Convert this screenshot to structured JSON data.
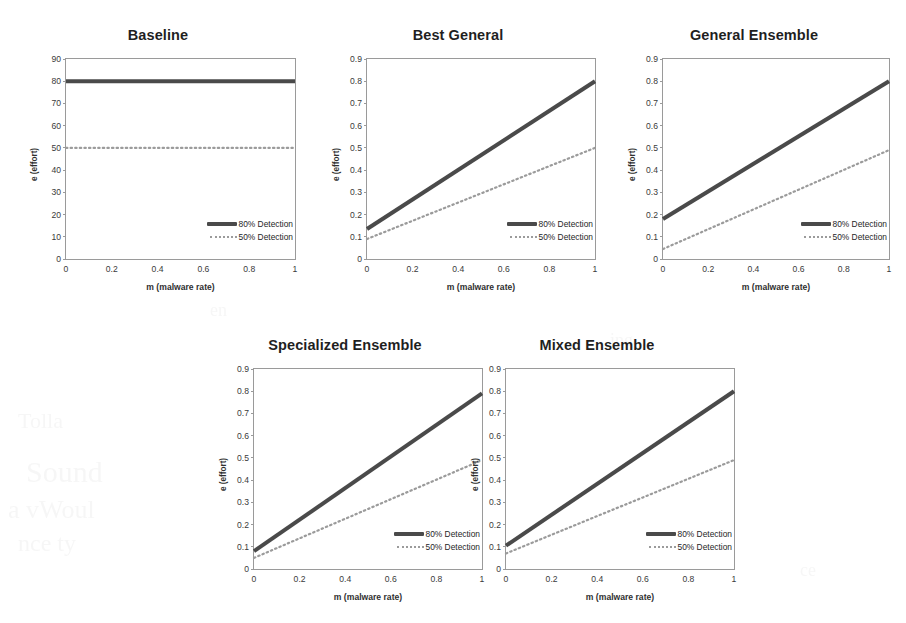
{
  "figure": {
    "series_labels": {
      "detection80": "80% Detection",
      "detection50": "50% Detection"
    },
    "axis": {
      "xlabel": "m (malware rate)",
      "ylabel": "e (effort)"
    }
  },
  "chart_data": [
    {
      "type": "line",
      "title": "Baseline",
      "xlabel": "m (malware rate)",
      "ylabel": "e (effort)",
      "xlim": [
        0,
        1
      ],
      "ylim": [
        0,
        90
      ],
      "xticks": [
        "0",
        "0.2",
        "0.4",
        "0.6",
        "0.8",
        "1"
      ],
      "yticks": [
        "0",
        "10",
        "20",
        "30",
        "40",
        "50",
        "60",
        "70",
        "80",
        "90"
      ],
      "grid": false,
      "legend_position": "lower-right",
      "x": [
        0,
        1
      ],
      "series": [
        {
          "name": "80% Detection",
          "style": "solid",
          "values": [
            80,
            80
          ]
        },
        {
          "name": "50% Detection",
          "style": "dotted",
          "values": [
            50,
            50
          ]
        }
      ]
    },
    {
      "type": "line",
      "title": "Best General",
      "xlabel": "m (malware rate)",
      "ylabel": "e (effort)",
      "xlim": [
        0,
        1
      ],
      "ylim": [
        0,
        0.9
      ],
      "xticks": [
        "0",
        "0.2",
        "0.4",
        "0.6",
        "0.8",
        "1"
      ],
      "yticks": [
        "0",
        "0.1",
        "0.2",
        "0.3",
        "0.4",
        "0.5",
        "0.6",
        "0.7",
        "0.8",
        "0.9"
      ],
      "grid": false,
      "legend_position": "lower-right",
      "x": [
        0,
        1
      ],
      "series": [
        {
          "name": "80% Detection",
          "style": "solid",
          "values": [
            0.135,
            0.8
          ]
        },
        {
          "name": "50% Detection",
          "style": "dotted",
          "values": [
            0.09,
            0.5
          ]
        }
      ]
    },
    {
      "type": "line",
      "title": "General Ensemble",
      "xlabel": "m (malware rate)",
      "ylabel": "e (effort)",
      "xlim": [
        0,
        1
      ],
      "ylim": [
        0,
        0.9
      ],
      "xticks": [
        "0",
        "0.2",
        "0.4",
        "0.6",
        "0.8",
        "1"
      ],
      "yticks": [
        "0",
        "0.1",
        "0.2",
        "0.3",
        "0.4",
        "0.5",
        "0.6",
        "0.7",
        "0.8",
        "0.9"
      ],
      "grid": false,
      "legend_position": "lower-right",
      "x": [
        0,
        1
      ],
      "series": [
        {
          "name": "80% Detection",
          "style": "solid",
          "values": [
            0.18,
            0.8
          ]
        },
        {
          "name": "50% Detection",
          "style": "dotted",
          "values": [
            0.045,
            0.49
          ]
        }
      ]
    },
    {
      "type": "line",
      "title": "Specialized Ensemble",
      "xlabel": "m (malware rate)",
      "ylabel": "e (effort)",
      "xlim": [
        0,
        1
      ],
      "ylim": [
        0,
        0.9
      ],
      "xticks": [
        "0",
        "0.2",
        "0.4",
        "0.6",
        "0.8",
        "1"
      ],
      "yticks": [
        "0",
        "0.1",
        "0.2",
        "0.3",
        "0.4",
        "0.5",
        "0.6",
        "0.7",
        "0.8",
        "0.9"
      ],
      "grid": false,
      "legend_position": "lower-right",
      "x": [
        0,
        1
      ],
      "series": [
        {
          "name": "80% Detection",
          "style": "solid",
          "values": [
            0.08,
            0.79
          ]
        },
        {
          "name": "50% Detection",
          "style": "dotted",
          "values": [
            0.05,
            0.49
          ]
        }
      ]
    },
    {
      "type": "line",
      "title": "Mixed Ensemble",
      "xlabel": "m (malware rate)",
      "ylabel": "e (effort)",
      "xlim": [
        0,
        1
      ],
      "ylim": [
        0,
        0.9
      ],
      "xticks": [
        "0",
        "0.2",
        "0.4",
        "0.6",
        "0.8",
        "1"
      ],
      "yticks": [
        "0",
        "0.1",
        "0.2",
        "0.3",
        "0.4",
        "0.5",
        "0.6",
        "0.7",
        "0.8",
        "0.9"
      ],
      "grid": false,
      "legend_position": "lower-right",
      "x": [
        0,
        1
      ],
      "series": [
        {
          "name": "80% Detection",
          "style": "solid",
          "values": [
            0.105,
            0.8
          ]
        },
        {
          "name": "50% Detection",
          "style": "dotted",
          "values": [
            0.07,
            0.49
          ]
        }
      ]
    }
  ],
  "colors": {
    "line_80": "#4a4a4a",
    "line_50": "#9b9b9b",
    "frame": "#9a9a9a",
    "text": "#2b2b2b",
    "background": "#ffffff"
  }
}
